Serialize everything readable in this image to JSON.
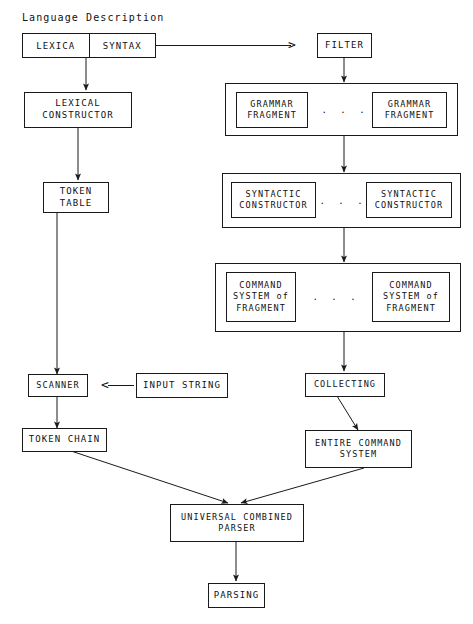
{
  "diagram": {
    "title": "Language Description",
    "caption_label": "Language Description",
    "ellipsis": ". . .",
    "arrow_right_glyph": ">",
    "arrow_left_glyph": "<",
    "nodes": {
      "lexica": "LEXICA",
      "syntax": "SYNTAX",
      "filter": "FILTER",
      "lexical_constructor": "LEXICAL\nCONSTRUCTOR",
      "grammar_fragment_left": "GRAMMAR\nFRAGMENT",
      "grammar_fragment_right": "GRAMMAR\nFRAGMENT",
      "token_table": "TOKEN\nTABLE",
      "syntactic_constructor_left": "SYNTACTIC\nCONSTRUCTOR",
      "syntactic_constructor_right": "SYNTACTIC\nCONSTRUCTOR",
      "command_system_left": "COMMAND\nSYSTEM of\nFRAGMENT",
      "command_system_right": "COMMAND\nSYSTEM of\nFRAGMENT",
      "scanner": "SCANNER",
      "input_string": "INPUT STRING",
      "collecting": "COLLECTING",
      "token_chain": "TOKEN CHAIN",
      "entire_command_system": "ENTIRE COMMAND\nSYSTEM",
      "universal_combined_parser": "UNIVERSAL COMBINED\nPARSER",
      "parsing": "PARSING"
    },
    "colors": {
      "background": "#ffffff",
      "stroke": "#1a1a1a",
      "text": "#111111"
    }
  }
}
